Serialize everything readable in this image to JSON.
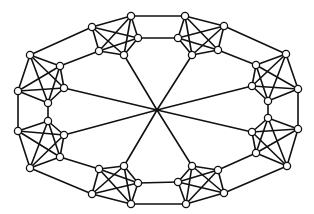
{
  "diagram": {
    "type": "graph",
    "colors": {
      "edge": "#111111",
      "node_fill": "#ffffff",
      "node_stroke": "#111111",
      "background": "#ffffff"
    },
    "node_radius": 3.6,
    "center": {
      "x": 157,
      "y": 110
    },
    "clusters": [
      {
        "name": "top-left",
        "nodes": [
          [
            92,
            27
          ],
          [
            131,
            16
          ],
          [
            138,
            38
          ],
          [
            124,
            55
          ],
          [
            99,
            51
          ]
        ],
        "hub_node": 3
      },
      {
        "name": "top-right",
        "nodes": [
          [
            185,
            16
          ],
          [
            224,
            26
          ],
          [
            218,
            50
          ],
          [
            192,
            55
          ],
          [
            178,
            38
          ]
        ],
        "hub_node": 3
      },
      {
        "name": "right-upper",
        "nodes": [
          [
            286,
            54
          ],
          [
            298,
            89
          ],
          [
            268,
            101
          ],
          [
            252,
            86
          ],
          [
            256,
            65
          ]
        ],
        "hub_node": 3
      },
      {
        "name": "right-lower",
        "nodes": [
          [
            268,
            118
          ],
          [
            298,
            129
          ],
          [
            287,
            166
          ],
          [
            256,
            153
          ],
          [
            252,
            132
          ]
        ],
        "hub_node": 4
      },
      {
        "name": "bottom-right",
        "nodes": [
          [
            192,
            166
          ],
          [
            218,
            170
          ],
          [
            224,
            193
          ],
          [
            186,
            204
          ],
          [
            178,
            182
          ]
        ],
        "hub_node": 0
      },
      {
        "name": "bottom-left",
        "nodes": [
          [
            124,
            166
          ],
          [
            138,
            183
          ],
          [
            131,
            204
          ],
          [
            92,
            194
          ],
          [
            99,
            169
          ]
        ],
        "hub_node": 0
      },
      {
        "name": "left-lower",
        "nodes": [
          [
            48,
            121
          ],
          [
            64,
            135
          ],
          [
            60,
            157
          ],
          [
            30,
            168
          ],
          [
            18,
            131
          ]
        ],
        "hub_node": 1
      },
      {
        "name": "left-upper",
        "nodes": [
          [
            30,
            55
          ],
          [
            60,
            66
          ],
          [
            64,
            88
          ],
          [
            48,
            103
          ],
          [
            18,
            91
          ]
        ],
        "hub_node": 2
      }
    ],
    "ring_links": [
      [
        [
          131,
          16
        ],
        [
          185,
          16
        ]
      ],
      [
        [
          138,
          38
        ],
        [
          178,
          38
        ]
      ],
      [
        [
          224,
          26
        ],
        [
          286,
          54
        ]
      ],
      [
        [
          218,
          50
        ],
        [
          256,
          65
        ]
      ],
      [
        [
          298,
          89
        ],
        [
          298,
          129
        ]
      ],
      [
        [
          268,
          101
        ],
        [
          268,
          118
        ]
      ],
      [
        [
          287,
          166
        ],
        [
          224,
          193
        ]
      ],
      [
        [
          256,
          153
        ],
        [
          218,
          170
        ]
      ],
      [
        [
          186,
          204
        ],
        [
          131,
          204
        ]
      ],
      [
        [
          178,
          182
        ],
        [
          138,
          183
        ]
      ],
      [
        [
          92,
          194
        ],
        [
          30,
          168
        ]
      ],
      [
        [
          99,
          169
        ],
        [
          60,
          157
        ]
      ],
      [
        [
          18,
          131
        ],
        [
          18,
          91
        ]
      ],
      [
        [
          48,
          121
        ],
        [
          48,
          103
        ]
      ],
      [
        [
          30,
          55
        ],
        [
          92,
          27
        ]
      ],
      [
        [
          60,
          66
        ],
        [
          99,
          51
        ]
      ]
    ]
  }
}
